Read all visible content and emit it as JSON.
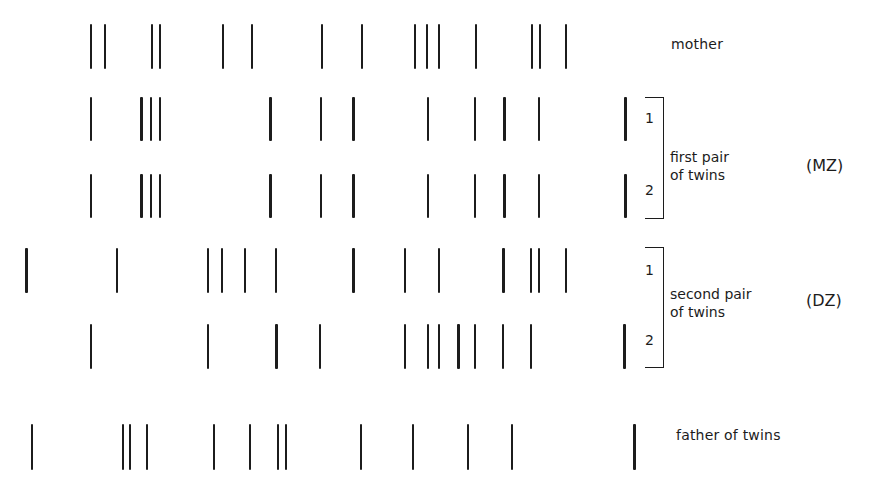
{
  "diagram": {
    "type": "DNA fingerprint comparison of a family with two pairs of twins",
    "band_color": "#1c1c1c",
    "background": "#ffffff",
    "rows": [
      {
        "id": "mother",
        "label": "mother",
        "top": 24,
        "height": 45,
        "bands": [
          91,
          105,
          152,
          160,
          223,
          252,
          322,
          362,
          415,
          427,
          439,
          476,
          532,
          540,
          566
        ],
        "thick": []
      },
      {
        "id": "mz-twin-1",
        "label": "1",
        "top": 97,
        "height": 44,
        "bands": [
          91,
          141,
          151,
          160,
          270,
          321,
          353,
          428,
          475,
          504,
          539,
          625
        ],
        "thick": [
          141,
          270,
          353,
          504,
          625
        ]
      },
      {
        "id": "mz-twin-2",
        "label": "2",
        "top": 174,
        "height": 44,
        "bands": [
          91,
          141,
          151,
          160,
          270,
          321,
          353,
          428,
          475,
          504,
          539,
          625
        ],
        "thick": [
          141,
          270,
          353,
          504,
          625
        ]
      },
      {
        "id": "dz-twin-1",
        "label": "1",
        "top": 248,
        "height": 45,
        "bands": [
          26,
          117,
          208,
          222,
          245,
          276,
          353,
          405,
          439,
          503,
          531,
          539,
          566
        ],
        "thick": [
          26,
          353,
          503
        ]
      },
      {
        "id": "dz-twin-2",
        "label": "2",
        "top": 324,
        "height": 45,
        "bands": [
          91,
          208,
          276,
          320,
          405,
          428,
          439,
          458,
          475,
          503,
          531,
          624
        ],
        "thick": [
          276,
          458,
          624
        ]
      },
      {
        "id": "father",
        "label": "father of twins",
        "top": 424,
        "height": 46,
        "bands": [
          32,
          123,
          130,
          147,
          214,
          250,
          278,
          286,
          361,
          413,
          468,
          512,
          634
        ],
        "thick": [
          634
        ]
      }
    ],
    "labels": {
      "mother": "mother",
      "father": "father of twins",
      "mz_pair_line1": "first pair",
      "mz_pair_line2": "of twins",
      "mz_group": "(MZ)",
      "dz_pair_line1": "second pair",
      "dz_pair_line2": "of twins",
      "dz_group": "(DZ)",
      "twin1": "1",
      "twin2": "2"
    }
  }
}
